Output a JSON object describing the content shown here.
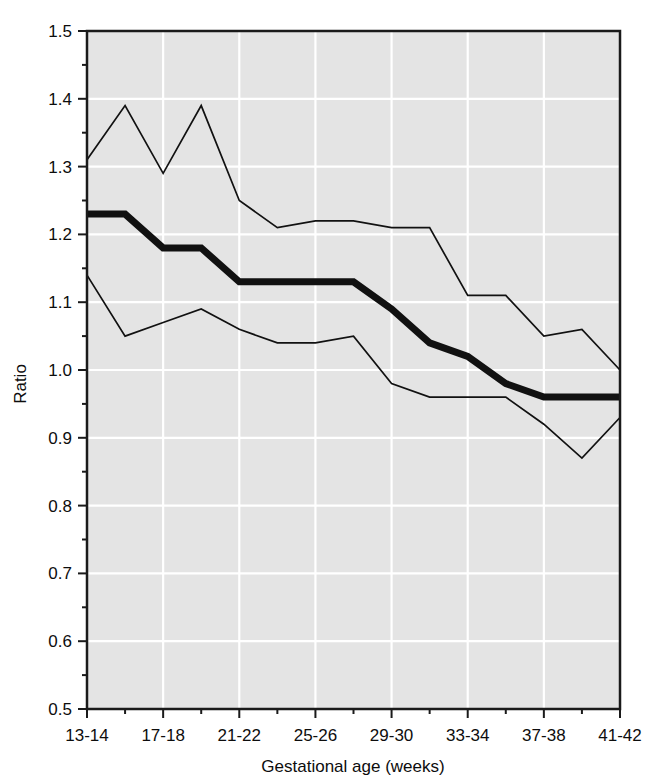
{
  "chart_data": {
    "type": "line",
    "title": "",
    "xlabel": "Gestational age (weeks)",
    "ylabel": "Ratio",
    "categories": [
      "13-14",
      "15-16",
      "17-18",
      "19-20",
      "21-22",
      "23-24",
      "25-26",
      "27-28",
      "29-30",
      "31-32",
      "33-34",
      "35-36",
      "37-38",
      "39-40",
      "41-42"
    ],
    "xtick_labels": [
      "13-14",
      "17-18",
      "21-22",
      "25-26",
      "29-30",
      "33-34",
      "37-38",
      "41-42"
    ],
    "xtick_indices": [
      0,
      2,
      4,
      6,
      8,
      10,
      12,
      14
    ],
    "ytick_labels": [
      "0.5",
      "0.6",
      "0.7",
      "0.8",
      "0.9",
      "1.0",
      "1.1",
      "1.2",
      "1.3",
      "1.4",
      "1.5"
    ],
    "ytick_values": [
      0.5,
      0.6,
      0.7,
      0.8,
      0.9,
      1.0,
      1.1,
      1.2,
      1.3,
      1.4,
      1.5
    ],
    "yminor_values": [
      0.55,
      0.65,
      0.75,
      0.85,
      0.95,
      1.05,
      1.15,
      1.25,
      1.35,
      1.45
    ],
    "ylim": [
      0.5,
      1.5
    ],
    "grid": true,
    "legend": "none",
    "series": [
      {
        "name": "upper-confidence-limit",
        "style": "thin",
        "values": [
          1.31,
          1.39,
          1.29,
          1.39,
          1.25,
          1.21,
          1.22,
          1.22,
          1.21,
          1.21,
          1.11,
          1.11,
          1.05,
          1.06,
          1.0
        ]
      },
      {
        "name": "ratio-estimate",
        "style": "thick",
        "values": [
          1.23,
          1.23,
          1.18,
          1.18,
          1.13,
          1.13,
          1.13,
          1.13,
          1.09,
          1.04,
          1.02,
          0.98,
          0.96,
          0.96,
          0.96
        ]
      },
      {
        "name": "lower-confidence-limit",
        "style": "thin",
        "values": [
          1.14,
          1.05,
          1.07,
          1.09,
          1.06,
          1.04,
          1.04,
          1.05,
          0.98,
          0.96,
          0.96,
          0.96,
          0.92,
          0.87,
          0.93
        ]
      }
    ],
    "colors": {
      "plot_background": "#e4e4e4",
      "gridline": "#ffffff",
      "line": "#111111",
      "frame": "#1a1a1a",
      "text": "#0d0d0d",
      "page_background": "#ffffff"
    }
  },
  "plot_geometry": {
    "left": 87,
    "right": 620,
    "top": 31,
    "bottom": 709
  }
}
